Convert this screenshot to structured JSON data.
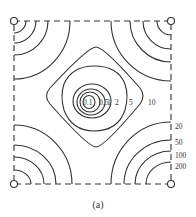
{
  "figure": {
    "caption": "(a)",
    "boundary_style": "dashed",
    "corner_marker": "open-circle",
    "line_color": "#333333",
    "contour_labels_center": [
      "0.1",
      "0.5",
      "1",
      "2",
      "5",
      "10"
    ],
    "contour_labels_right": [
      "20",
      "50",
      "100",
      "200"
    ]
  }
}
